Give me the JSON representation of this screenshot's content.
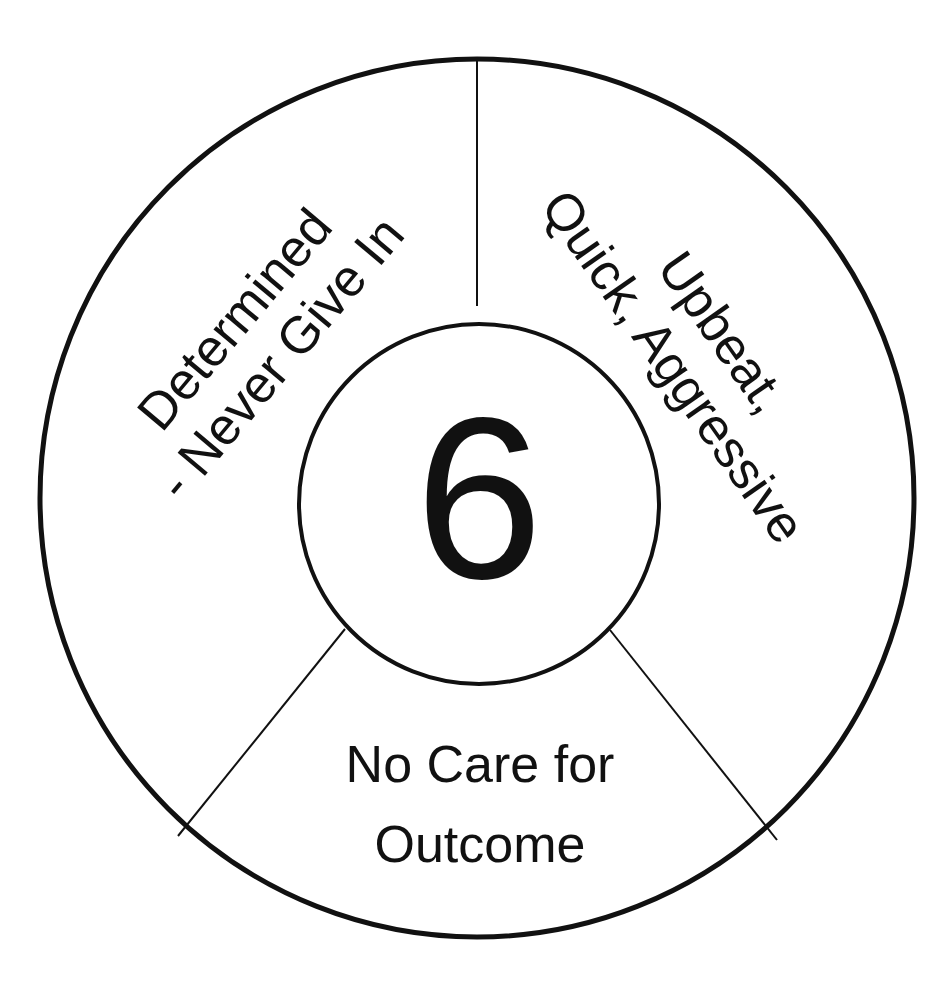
{
  "diagram": {
    "center_number": "6",
    "segments": [
      {
        "id": "left",
        "lines": [
          "Determined",
          "- Never Give In"
        ]
      },
      {
        "id": "right",
        "lines": [
          "Upbeat,",
          "Quick, Aggressive"
        ]
      },
      {
        "id": "bottom",
        "lines": [
          "No Care for",
          "Outcome"
        ]
      }
    ],
    "colors": {
      "stroke": "#111111",
      "background": "#ffffff",
      "text": "#111111"
    }
  }
}
